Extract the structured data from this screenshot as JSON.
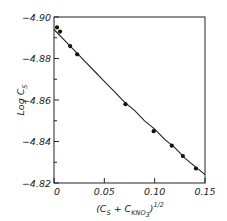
{
  "chart_data": {
    "type": "scatter",
    "title": "",
    "xlabel": "(C_S + C_KNO3)^1/2",
    "ylabel": "Log C_S",
    "xlim": [
      0,
      0.15
    ],
    "ylim": [
      -4.82,
      -4.9
    ],
    "y_axis_inverted": true,
    "x_ticks": [
      0,
      0.05,
      0.1,
      0.15
    ],
    "x_tick_labels": [
      "0",
      "0.05",
      "0.10",
      "0.15"
    ],
    "y_ticks": [
      -4.9,
      -4.88,
      -4.86,
      -4.84,
      -4.82
    ],
    "y_tick_labels": [
      "-4.90",
      "-4.88",
      "-4.86",
      "-4.84",
      "-4.82"
    ],
    "grid": false,
    "legend": null,
    "series": [
      {
        "name": "measured",
        "style": "points",
        "x": [
          0.003,
          0.006,
          0.016,
          0.023,
          0.071,
          0.099,
          0.117,
          0.128,
          0.141
        ],
        "y": [
          -4.895,
          -4.893,
          -4.886,
          -4.882,
          -4.858,
          -4.845,
          -4.838,
          -4.833,
          -4.827
        ]
      },
      {
        "name": "fitted curve",
        "style": "line",
        "x": [
          0.0,
          0.01,
          0.02,
          0.03,
          0.04,
          0.05,
          0.06,
          0.07,
          0.08,
          0.09,
          0.1,
          0.11,
          0.12,
          0.13,
          0.14,
          0.15
        ],
        "y": [
          -4.894,
          -4.889,
          -4.884,
          -4.879,
          -4.874,
          -4.869,
          -4.864,
          -4.859,
          -4.855,
          -4.85,
          -4.846,
          -4.841,
          -4.837,
          -4.832,
          -4.828,
          -4.824
        ]
      }
    ]
  },
  "axes": {
    "y_label_main": "Log C",
    "y_label_sub": "S",
    "x_label_open": "(C",
    "x_label_sub1": "S",
    "x_label_plus": " + C",
    "x_label_sub2": "KNO",
    "x_label_sub3": "3",
    "x_label_close": ")",
    "x_label_exp": "1/2"
  }
}
